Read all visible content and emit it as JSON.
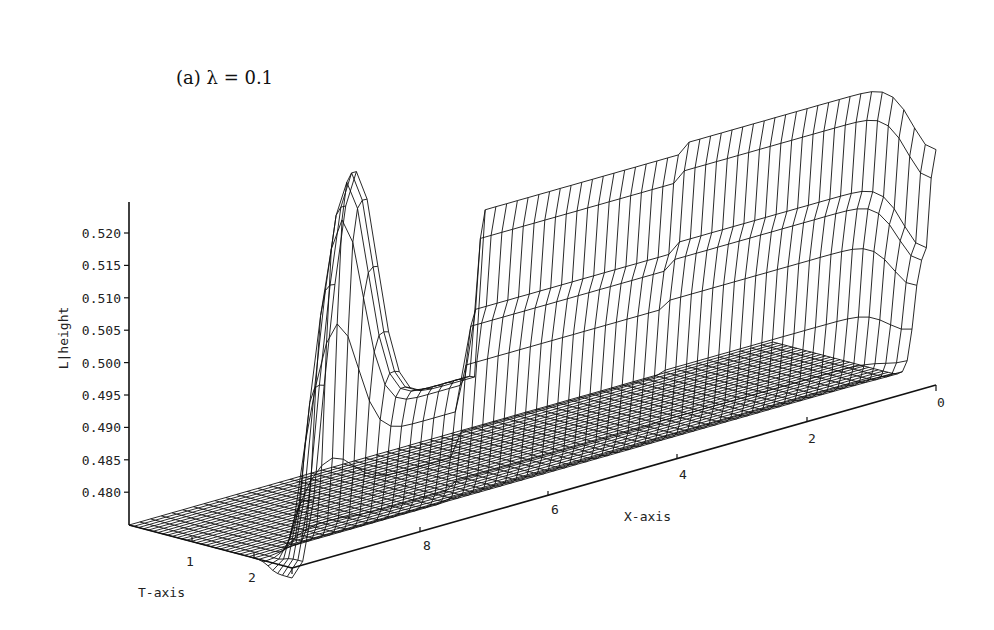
{
  "chart_data": {
    "type": "surface3d",
    "title": "(a) λ = 0.1",
    "zlabel": "L|height",
    "xlabel": "X-axis",
    "tlabel": "T-axis",
    "z_ticks": [
      "0.520",
      "0.515",
      "0.510",
      "0.505",
      "0.500",
      "0.495",
      "0.490",
      "0.485",
      "0.480"
    ],
    "x_ticks": [
      "8",
      "6",
      "4",
      "2",
      "0"
    ],
    "t_ticks": [
      "1",
      "2"
    ],
    "zlim": [
      0.476,
      0.526
    ],
    "xlim": [
      0,
      10
    ],
    "tlim": [
      0,
      2.2
    ],
    "grid": false,
    "surface_profiles": [
      {
        "t": 0.0,
        "x": [
          10,
          9,
          8,
          7,
          6,
          4,
          2,
          0
        ],
        "z": [
          0.4765,
          0.4765,
          0.4765,
          0.4765,
          0.4765,
          0.4765,
          0.4765,
          0.4765
        ]
      },
      {
        "t": 2.0,
        "x": [
          10,
          9.5,
          9,
          8.5,
          8,
          7.5,
          7,
          6,
          4,
          2,
          1,
          0.5,
          0
        ],
        "z": [
          0.48,
          0.495,
          0.514,
          0.506,
          0.5,
          0.5,
          0.505,
          0.507,
          0.508,
          0.509,
          0.509,
          0.503,
          0.498
        ]
      },
      {
        "t": 2.2,
        "x": [
          7.2,
          7,
          6,
          4,
          2,
          0.5,
          0
        ],
        "z": [
          0.505,
          0.525,
          0.525,
          0.525,
          0.525,
          0.524,
          0.499
        ]
      }
    ]
  }
}
